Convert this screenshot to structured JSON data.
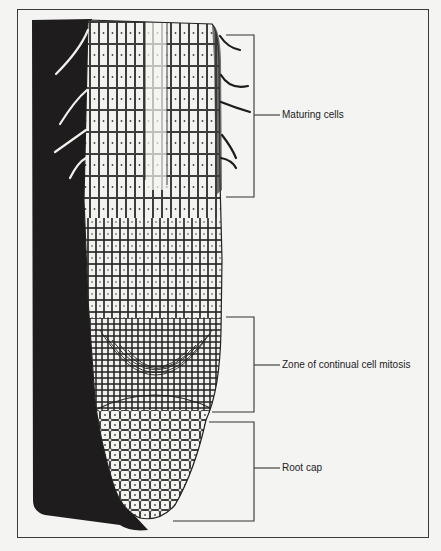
{
  "diagram": {
    "type": "biological-illustration",
    "labels": [
      {
        "id": "maturing",
        "text": "Maturing cells",
        "bracket_top": 35,
        "bracket_bottom": 197,
        "label_y": 115
      },
      {
        "id": "mitosis",
        "text": "Zone of continual cell mitosis",
        "bracket_top": 317,
        "bracket_bottom": 412,
        "label_y": 365
      },
      {
        "id": "rootcap",
        "text": "Root cap",
        "bracket_top": 422,
        "bracket_bottom": 521,
        "label_y": 468
      }
    ],
    "colors": {
      "background": "#f4f4f2",
      "soil": "#1e1c1c",
      "cell_wall": "#2a2a2a",
      "cell_fill": "#f2f2ee",
      "line": "#333333"
    }
  }
}
